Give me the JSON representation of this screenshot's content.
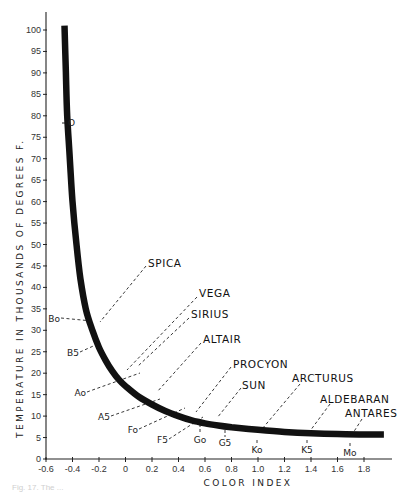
{
  "chart_data": {
    "type": "line",
    "title": "",
    "xlabel": "COLOR INDEX",
    "ylabel": "TEMPERATURE IN THOUSANDS OF DEGREES F.",
    "xlim": [
      -0.6,
      2.0
    ],
    "ylim": [
      0,
      105
    ],
    "grid": false,
    "x_ticks": [
      -0.6,
      -0.4,
      -0.2,
      0,
      0.2,
      0.4,
      0.6,
      0.8,
      1.0,
      1.2,
      1.4,
      1.6,
      1.8
    ],
    "x_tick_labels": [
      "-0.6",
      "-0.4",
      "-0.2",
      "0",
      "0.2",
      "0.4",
      "0.6",
      "0.8",
      "1.0",
      "1.2",
      "1.4",
      "1.6",
      "1.8"
    ],
    "y_ticks": [
      0,
      5,
      10,
      15,
      20,
      25,
      30,
      35,
      40,
      45,
      50,
      55,
      60,
      65,
      70,
      75,
      80,
      85,
      90,
      95,
      100
    ],
    "series": [
      {
        "name": "Temperature vs Color Index",
        "x": [
          -0.46,
          -0.45,
          -0.44,
          -0.42,
          -0.4,
          -0.37,
          -0.34,
          -0.3,
          -0.25,
          -0.2,
          -0.15,
          -0.1,
          -0.05,
          0.0,
          0.1,
          0.2,
          0.3,
          0.4,
          0.5,
          0.6,
          0.7,
          0.8,
          1.0,
          1.2,
          1.4,
          1.6,
          1.8,
          1.95
        ],
        "values": [
          101,
          90,
          80,
          70,
          60,
          50,
          42,
          35,
          30,
          26,
          23,
          20.5,
          18.5,
          17,
          14.5,
          12.7,
          11.2,
          10,
          9,
          8.3,
          7.8,
          7.4,
          6.8,
          6.3,
          6.0,
          5.8,
          5.7,
          5.7
        ]
      }
    ],
    "spectral_classes": [
      {
        "label": "O",
        "x": -0.44,
        "y": 78
      },
      {
        "label": "Bo",
        "x": -0.33,
        "y": 31
      },
      {
        "label": "B5",
        "x": -0.2,
        "y": 26
      },
      {
        "label": "Ao",
        "x": 0.0,
        "y": 17
      },
      {
        "label": "A5",
        "x": 0.15,
        "y": 13.5
      },
      {
        "label": "Fo",
        "x": 0.3,
        "y": 11.2
      },
      {
        "label": "F5",
        "x": 0.45,
        "y": 9.5
      },
      {
        "label": "Go",
        "x": 0.57,
        "y": 8.5
      },
      {
        "label": "G5",
        "x": 0.75,
        "y": 7.6
      },
      {
        "label": "Ko",
        "x": 1.0,
        "y": 6.8
      },
      {
        "label": "K5",
        "x": 1.38,
        "y": 6.0
      },
      {
        "label": "Mo",
        "x": 1.7,
        "y": 5.7
      }
    ],
    "annotations": [
      {
        "label": "SPICA",
        "x": -0.2,
        "y": 28
      },
      {
        "label": "VEGA",
        "x": 0.0,
        "y": 18
      },
      {
        "label": "SIRIUS",
        "x": 0.0,
        "y": 17
      },
      {
        "label": "ALTAIR",
        "x": 0.22,
        "y": 12.5
      },
      {
        "label": "PROCYON",
        "x": 0.42,
        "y": 9.8
      },
      {
        "label": "SUN",
        "x": 0.63,
        "y": 8.2
      },
      {
        "label": "ARCTURUS",
        "x": 1.02,
        "y": 6.8
      },
      {
        "label": "ALDEBARAN",
        "x": 1.4,
        "y": 6.0
      },
      {
        "label": "ANTARES",
        "x": 1.75,
        "y": 5.7
      }
    ]
  },
  "caption": "Fig. 17. The ..."
}
